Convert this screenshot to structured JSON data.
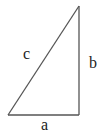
{
  "diagram": {
    "type": "right-triangle",
    "stroke_color": "#555555",
    "label_color": "#222222",
    "vertices": {
      "top": [
        79,
        6
      ],
      "bottom_left": [
        8,
        115
      ],
      "bottom_right": [
        79,
        115
      ]
    },
    "labels": {
      "hypotenuse": "c",
      "vertical_leg": "b",
      "horizontal_leg": "a"
    }
  }
}
